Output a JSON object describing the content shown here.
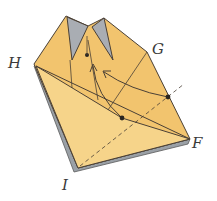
{
  "diagram": {
    "labels": {
      "H": "H",
      "G": "G",
      "F": "F",
      "I": "I"
    },
    "colors": {
      "paper": "#f2c46e",
      "paper_light": "#f7d98f",
      "paper_shadow": "#e3a94f",
      "pocket_grey": "#a9adb3",
      "edge_grey": "#8f959c",
      "line": "#4a4036"
    },
    "markers": [
      "fold-point-center",
      "fold-point-right",
      "pocket-point"
    ],
    "arrows": [
      "fold-arrow-left",
      "fold-arrow-right"
    ]
  }
}
